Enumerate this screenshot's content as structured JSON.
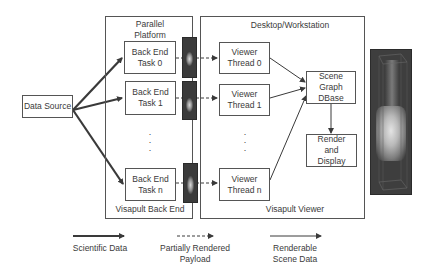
{
  "diagram": {
    "data_source": "Data Source",
    "backend_group": {
      "title": "Parallel\nPlatform",
      "footer": "Visapult Back End",
      "tasks": [
        "Back End\nTask 0",
        "Back End\nTask 1",
        "Back End\nTask n"
      ],
      "ellipsis": ".\n.\n."
    },
    "viewer_group": {
      "title": "Desktop/Workstation",
      "footer": "Visapult Viewer",
      "threads": [
        "Viewer\nThread 0",
        "Viewer\nThread 1",
        "Viewer\nThread n"
      ],
      "ellipsis": ".\n.\n.",
      "scene_graph": "Scene\nGraph\nDBase",
      "render_display": "Render\nand\nDisplay"
    },
    "rendered_image": "volume-render-image"
  },
  "legend": [
    {
      "style": "thick-solid-arrow",
      "label": "Scientific Data"
    },
    {
      "style": "dashed-arrow",
      "label": "Partially Rendered\nPayload"
    },
    {
      "style": "thin-solid-arrow",
      "label": "Renderable\nScene Data"
    }
  ],
  "colors": {
    "line": "#3a3a3a",
    "box_border": "#555555",
    "thumbnail_bg": "#3b3b3b"
  }
}
